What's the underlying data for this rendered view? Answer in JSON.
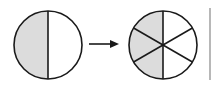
{
  "diagram": {
    "colors": {
      "stroke": "#1a1a1a",
      "shade": "#dcdcdc",
      "background": "#ffffff",
      "divider": "#888888"
    },
    "left_circle": {
      "parts": 2,
      "shaded": 1,
      "fraction": "1/2"
    },
    "arrow": {
      "direction": "right"
    },
    "right_circle": {
      "parts": 6,
      "shaded": 3,
      "fraction": "3/6"
    }
  }
}
